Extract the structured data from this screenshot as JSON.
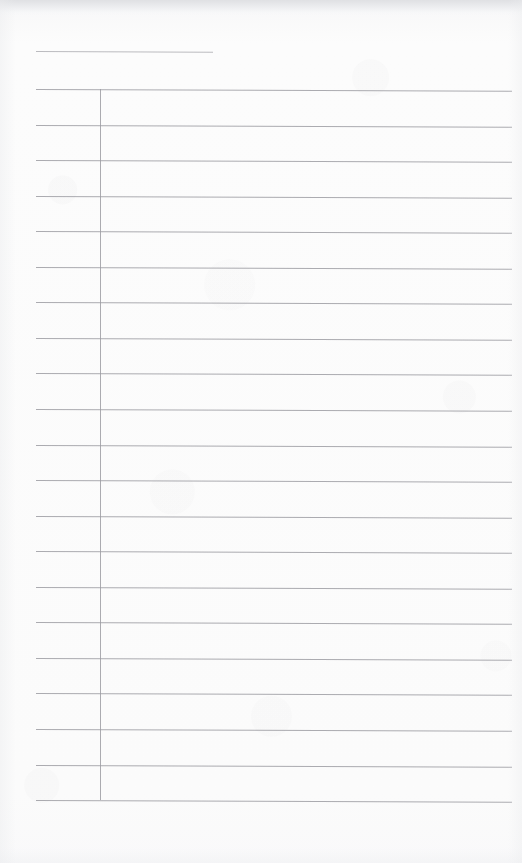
{
  "document": {
    "kind": "scanned-blank-ruled-table",
    "page_width": 522,
    "page_height": 863,
    "paper_color": "#fbfbfb",
    "rule_color": "#9c9ca2",
    "scan_edge_color": "#dedfe2",
    "title": "",
    "body_text": ""
  },
  "heading_rule": {
    "label": "",
    "x": 36,
    "y": 51,
    "width": 177,
    "color": "#a2a2a8"
  },
  "table": {
    "caption": "",
    "left": 36,
    "right": 512,
    "top": 89,
    "bottom": 800,
    "row_count": 20,
    "row_height": 35.55,
    "skew_degrees": 0.22,
    "column_divider_x": 100,
    "columns": [
      {
        "name": "label-column",
        "header": "",
        "left": 36,
        "right": 100,
        "width": 64
      },
      {
        "name": "entry-column",
        "header": "",
        "left": 100,
        "right": 512,
        "width": 412
      }
    ],
    "rule_y_positions": [
      89,
      124.6,
      160.1,
      195.7,
      231.2,
      266.8,
      302.3,
      337.9,
      373.4,
      409,
      444.5,
      480.1,
      515.6,
      551.2,
      586.7,
      622.3,
      657.8,
      693.4,
      728.9,
      764.5,
      800
    ],
    "rows": [
      {
        "label": "",
        "entry": ""
      },
      {
        "label": "",
        "entry": ""
      },
      {
        "label": "",
        "entry": ""
      },
      {
        "label": "",
        "entry": ""
      },
      {
        "label": "",
        "entry": ""
      },
      {
        "label": "",
        "entry": ""
      },
      {
        "label": "",
        "entry": ""
      },
      {
        "label": "",
        "entry": ""
      },
      {
        "label": "",
        "entry": ""
      },
      {
        "label": "",
        "entry": ""
      },
      {
        "label": "",
        "entry": ""
      },
      {
        "label": "",
        "entry": ""
      },
      {
        "label": "",
        "entry": ""
      },
      {
        "label": "",
        "entry": ""
      },
      {
        "label": "",
        "entry": ""
      },
      {
        "label": "",
        "entry": ""
      },
      {
        "label": "",
        "entry": ""
      },
      {
        "label": "",
        "entry": ""
      },
      {
        "label": "",
        "entry": ""
      },
      {
        "label": "",
        "entry": ""
      }
    ]
  }
}
